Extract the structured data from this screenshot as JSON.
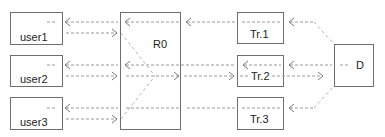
{
  "diagram": {
    "nodes": {
      "user1": {
        "label": "user1"
      },
      "user2": {
        "label": "user2"
      },
      "user3": {
        "label": "user3"
      },
      "r0": {
        "label": "R0"
      },
      "tr1": {
        "label": "Tr.1"
      },
      "tr2": {
        "label": "Tr.2"
      },
      "tr3": {
        "label": "Tr.3"
      },
      "d": {
        "label": "D"
      }
    },
    "edges": [
      {
        "from": "R0",
        "to": "user1",
        "style": "dashed-arrow"
      },
      {
        "from": "user1",
        "to": "R0",
        "style": "dashed-arrow"
      },
      {
        "from": "R0",
        "to": "user2",
        "style": "dashed-arrow"
      },
      {
        "from": "user2",
        "to": "R0",
        "style": "dashed-arrow"
      },
      {
        "from": "R0",
        "to": "user3",
        "style": "dashed-arrow"
      },
      {
        "from": "user3",
        "to": "R0",
        "style": "dashed-arrow"
      },
      {
        "from": "Tr.1",
        "to": "R0",
        "style": "dashed-arrow"
      },
      {
        "from": "Tr.2",
        "to": "R0",
        "style": "dashed-arrow"
      },
      {
        "from": "R0",
        "to": "Tr.2",
        "style": "dashed-arrow"
      },
      {
        "from": "Tr.3",
        "to": "R0",
        "style": "dashed-line"
      },
      {
        "from": "D",
        "to": "Tr.1",
        "style": "dashed-arrow"
      },
      {
        "from": "D",
        "to": "Tr.2",
        "style": "dashed-arrow"
      },
      {
        "from": "Tr.2",
        "to": "D",
        "style": "dashed-arrow"
      },
      {
        "from": "D",
        "to": "Tr.3",
        "style": "dashed-arrow"
      }
    ],
    "colors": {
      "box_stroke": "#6e6e6e",
      "line": "#9a9a9a",
      "text": "#222222"
    }
  }
}
